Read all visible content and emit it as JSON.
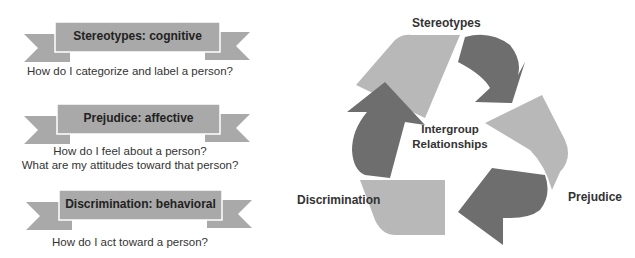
{
  "left_panel": {
    "items": [
      {
        "title": "Stereotypes: cognitive",
        "caption_lines": [
          "How do I categorize and label a person?"
        ]
      },
      {
        "title": "Prejudice: affective",
        "caption_lines": [
          "How do I feel about a person?",
          "What are my attitudes toward that person?"
        ]
      },
      {
        "title": "Discrimination: behavioral",
        "caption_lines": [
          "How do I act toward a person?"
        ]
      }
    ]
  },
  "cycle": {
    "center_label_lines": [
      "Intergroup",
      "Relationships"
    ],
    "nodes": [
      {
        "label": "Stereotypes"
      },
      {
        "label": "Prejudice"
      },
      {
        "label": "Discrimination"
      }
    ]
  },
  "colors": {
    "ribbon_fill": "#a9a9a9",
    "ribbon_border": "#ffffff",
    "band_light": "#b8b8b8",
    "arrow_dark": "#6e6e6e",
    "text": "#333333"
  }
}
